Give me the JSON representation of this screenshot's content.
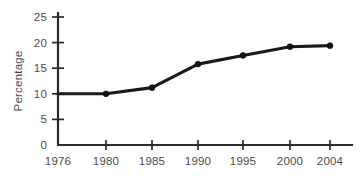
{
  "chart_data": {
    "type": "line",
    "title": "",
    "subtitle": "",
    "xlabel": "",
    "ylabel": "Percentage",
    "categories": [
      "1976",
      "1980",
      "1985",
      "1990",
      "1995",
      "2000",
      "2004"
    ],
    "values": [
      10,
      10,
      11.2,
      15.8,
      17.5,
      19.2,
      19.4
    ],
    "series": [
      {
        "name": "Percentage",
        "values": [
          10,
          10,
          11.2,
          15.8,
          17.5,
          19.2,
          19.4
        ],
        "color": "#1a1a1a",
        "marker": "circle"
      }
    ],
    "x_tick_labels": [
      "1976",
      "1980",
      "1985",
      "1990",
      "1995",
      "2000",
      "2004"
    ],
    "y_tick_labels": [
      "0",
      "5",
      "10",
      "15",
      "20",
      "25"
    ],
    "y_tick_values": [
      0,
      5,
      10,
      15,
      20,
      25
    ],
    "ylim": [
      0,
      25
    ],
    "grid": false,
    "legend": false,
    "legend_position": "none",
    "annotations": [],
    "markers_shown_at": [
      "1980",
      "1985",
      "1990",
      "1995",
      "2000",
      "2004"
    ],
    "first_point_marker": false
  },
  "style": {
    "background": "#ffffff",
    "line_color": "#1a1a1a",
    "axis_color": "#2b2b2b",
    "text_color": "#4a4a4a"
  },
  "geometry": {
    "x_positions": [
      58,
      106,
      152,
      198,
      243,
      290,
      330
    ],
    "y_baseline": 145,
    "y_top": 17,
    "px_per_unit": 5.12,
    "axis_right": 352,
    "y_axis_x": 58,
    "tick_len_x": 5,
    "tick_len_y": 6
  }
}
